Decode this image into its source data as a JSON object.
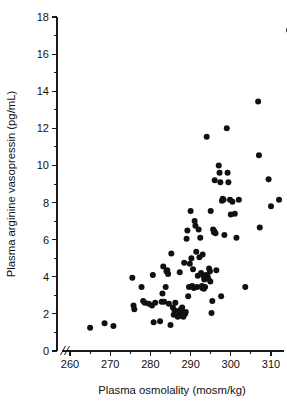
{
  "chart_data": {
    "type": "scatter",
    "title": "",
    "xlabel": "Plasma osmolality (mosm/kg)",
    "ylabel": "Plasma arginine vasopressin (pg/mL)",
    "xlim": [
      258,
      317
    ],
    "ylim": [
      0,
      18
    ],
    "xticks": [
      260,
      270,
      280,
      290,
      300,
      310
    ],
    "yticks": [
      0,
      2,
      4,
      6,
      8,
      10,
      12,
      14,
      16,
      18
    ],
    "xtick_labels": [
      "260",
      "270",
      "280",
      "290",
      "300",
      "310"
    ],
    "ytick_labels": [
      "0",
      "2",
      "4",
      "6",
      "8",
      "10",
      "12",
      "14",
      "16",
      "18"
    ],
    "x_minor_ticks": [
      265,
      275,
      285,
      295,
      305,
      315
    ],
    "y_minor_ticks": [
      1,
      3,
      5,
      7,
      9,
      11,
      13,
      15,
      17
    ],
    "grid": false,
    "legend": false,
    "legend_position": "none",
    "axis_break": {
      "axis": "x",
      "symbol": "//",
      "note": "broken x-axis between 0 origin and 260"
    },
    "marker": {
      "shape": "circle",
      "filled": true,
      "color": "#111111",
      "radius_px": 3.0
    },
    "series": [
      {
        "name": "subjects",
        "n_points": 110,
        "points": [
          [
            265.0,
            1.25
          ],
          [
            268.6,
            1.5
          ],
          [
            270.8,
            1.35
          ],
          [
            275.5,
            3.95
          ],
          [
            275.8,
            2.45
          ],
          [
            276.0,
            2.25
          ],
          [
            277.8,
            3.45
          ],
          [
            278.2,
            2.7
          ],
          [
            279.6,
            2.55
          ],
          [
            280.4,
            2.45
          ],
          [
            280.6,
            4.1
          ],
          [
            280.8,
            1.55
          ],
          [
            281.2,
            2.6
          ],
          [
            282.4,
            1.6
          ],
          [
            283.0,
            3.1
          ],
          [
            283.2,
            4.55
          ],
          [
            283.4,
            2.65
          ],
          [
            283.8,
            3.45
          ],
          [
            284.0,
            4.3
          ],
          [
            284.2,
            4.35
          ],
          [
            284.4,
            4.15
          ],
          [
            284.6,
            2.55
          ],
          [
            285.0,
            1.4
          ],
          [
            285.2,
            5.25
          ],
          [
            285.6,
            2.35
          ],
          [
            286.2,
            2.6
          ],
          [
            286.8,
            1.85
          ],
          [
            287.0,
            1.95
          ],
          [
            287.1,
            2.15
          ],
          [
            287.3,
            4.25
          ],
          [
            287.4,
            1.9
          ],
          [
            287.6,
            2.25
          ],
          [
            287.8,
            1.95
          ],
          [
            288.0,
            2.05
          ],
          [
            288.2,
            1.85
          ],
          [
            288.4,
            4.75
          ],
          [
            288.6,
            2.0
          ],
          [
            289.0,
            6.05
          ],
          [
            289.2,
            6.5
          ],
          [
            289.4,
            2.95
          ],
          [
            289.6,
            3.45
          ],
          [
            290.0,
            7.55
          ],
          [
            290.2,
            5.0
          ],
          [
            290.4,
            3.5
          ],
          [
            290.6,
            4.4
          ],
          [
            291.0,
            7.0
          ],
          [
            291.2,
            6.75
          ],
          [
            291.4,
            5.35
          ],
          [
            291.6,
            3.45
          ],
          [
            292.0,
            6.55
          ],
          [
            292.2,
            5.05
          ],
          [
            292.4,
            6.1
          ],
          [
            292.6,
            4.2
          ],
          [
            292.8,
            3.5
          ],
          [
            293.0,
            5.2
          ],
          [
            293.2,
            4.05
          ],
          [
            293.4,
            3.85
          ],
          [
            293.6,
            3.45
          ],
          [
            293.8,
            4.1
          ],
          [
            294.0,
            11.55
          ],
          [
            294.2,
            4.05
          ],
          [
            294.4,
            3.9
          ],
          [
            294.6,
            4.45
          ],
          [
            294.8,
            4.3
          ],
          [
            295.0,
            7.55
          ],
          [
            295.2,
            2.05
          ],
          [
            295.4,
            2.7
          ],
          [
            295.6,
            6.55
          ],
          [
            295.8,
            6.4
          ],
          [
            296.0,
            9.2
          ],
          [
            296.4,
            4.35
          ],
          [
            297.0,
            10.0
          ],
          [
            297.2,
            9.6
          ],
          [
            297.4,
            9.1
          ],
          [
            297.6,
            2.95
          ],
          [
            298.0,
            8.2
          ],
          [
            298.2,
            8.15
          ],
          [
            298.4,
            6.25
          ],
          [
            299.0,
            12.0
          ],
          [
            299.2,
            9.6
          ],
          [
            299.4,
            9.1
          ],
          [
            300.0,
            7.35
          ],
          [
            300.4,
            8.05
          ],
          [
            301.0,
            7.4
          ],
          [
            301.4,
            6.1
          ],
          [
            302.0,
            8.15
          ],
          [
            303.6,
            3.45
          ],
          [
            306.8,
            13.45
          ],
          [
            307.0,
            10.55
          ],
          [
            307.2,
            6.65
          ],
          [
            309.4,
            9.25
          ],
          [
            310.0,
            7.8
          ],
          [
            312.0,
            8.15
          ],
          [
            314.5,
            17.3
          ],
          [
            286.0,
            2.2
          ],
          [
            288.8,
            2.1
          ],
          [
            289.8,
            4.7
          ],
          [
            291.8,
            4.05
          ],
          [
            293.3,
            3.35
          ],
          [
            294.9,
            3.75
          ],
          [
            296.2,
            6.35
          ],
          [
            297.8,
            8.1
          ],
          [
            287.9,
            2.35
          ],
          [
            285.8,
            1.95
          ],
          [
            282.8,
            2.65
          ],
          [
            278.6,
            2.6
          ],
          [
            290.8,
            3.4
          ],
          [
            292.9,
            3.4
          ],
          [
            295.9,
            6.45
          ],
          [
            299.8,
            8.15
          ]
        ]
      }
    ]
  },
  "figure": {
    "background_color": "#ffffff",
    "ink_color": "#111111"
  }
}
